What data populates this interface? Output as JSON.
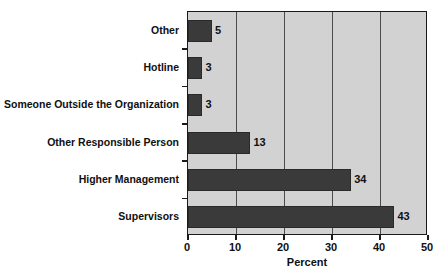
{
  "chart_data": {
    "type": "bar",
    "orientation": "horizontal",
    "title": "",
    "xlabel": "Percent",
    "ylabel": "",
    "categories": [
      "Other",
      "Hotline",
      "Someone Outside the Organization",
      "Other Responsible Person",
      "Higher Management",
      "Supervisors"
    ],
    "values": [
      5,
      3,
      3,
      13,
      34,
      43
    ],
    "value_labels": [
      "5",
      "3",
      "3",
      "13",
      "34",
      "43"
    ],
    "xlim": [
      0,
      50
    ],
    "xticks": [
      0,
      10,
      20,
      30,
      40,
      50
    ],
    "xtick_labels": [
      "0",
      "10",
      "20",
      "30",
      "40",
      "50"
    ],
    "grid": true,
    "grid_axis": "x",
    "legend": false,
    "colors": {
      "bar": "#3a3a3a",
      "plot_background": "#d2d2d2",
      "page_background": "#ffffff",
      "axis": "#1a1a1a",
      "gridline": "#4c4c4c",
      "text": "#101010"
    }
  }
}
